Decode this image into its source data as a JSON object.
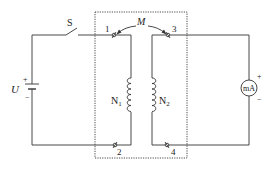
{
  "diagram": {
    "type": "circuit",
    "labels": {
      "switch": "S",
      "source": "U",
      "source_plus": "+",
      "source_minus": "−",
      "mutual_inductance": "M",
      "coil_primary": "N",
      "coil_primary_sub": "1",
      "coil_secondary": "N",
      "coil_secondary_sub": "2",
      "terminal_1": "1",
      "terminal_2": "2",
      "terminal_3": "3",
      "terminal_4": "4",
      "meter": "mA",
      "meter_plus": "+",
      "meter_minus": "−"
    },
    "colors": {
      "line": "#333333",
      "text": "#222222",
      "background": "#ffffff"
    }
  }
}
